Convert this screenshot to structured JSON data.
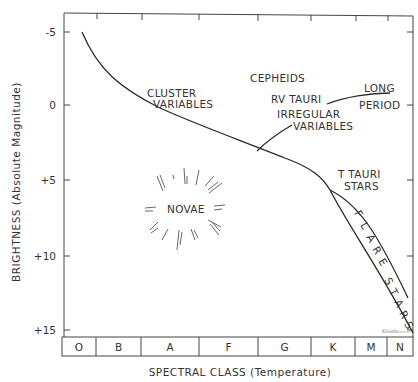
{
  "chart_data": {
    "type": "diagram",
    "title": "",
    "xlabel": "SPECTRAL CLASS (Temperature)",
    "ylabel": "BRIGHTNESS (Absolute Magnitude)",
    "ylim": [
      -5,
      15
    ],
    "y_inverted": true,
    "y_ticks": [
      "-5",
      "0",
      "+5",
      "+10",
      "+15"
    ],
    "y_tick_values": [
      -5,
      0,
      5,
      10,
      15
    ],
    "spectral_classes": [
      "O",
      "B",
      "A",
      "F",
      "G",
      "K",
      "M",
      "N"
    ],
    "curves": [
      {
        "name": "main-sequence",
        "points": [
          [
            0.1,
            -5
          ],
          [
            0.5,
            -2.5
          ],
          [
            1.0,
            -0.5
          ],
          [
            1.6,
            0.7
          ],
          [
            2.4,
            1.7
          ],
          [
            3.2,
            2.8
          ],
          [
            4.0,
            4.0
          ],
          [
            5.0,
            5.6
          ]
        ]
      },
      {
        "name": "flare-stars-upper",
        "points": [
          [
            5.0,
            5.6
          ],
          [
            5.5,
            6.5
          ],
          [
            6.0,
            8.5
          ],
          [
            6.6,
            12.5
          ]
        ]
      },
      {
        "name": "flare-stars-lower",
        "points": [
          [
            5.0,
            5.6
          ],
          [
            5.4,
            7.0
          ],
          [
            6.0,
            11.0
          ],
          [
            7.0,
            15
          ]
        ]
      },
      {
        "name": "irregular-to-long-period",
        "points": [
          [
            3.1,
            2.5
          ],
          [
            3.6,
            1.2
          ],
          [
            4.6,
            0.4
          ],
          [
            6.4,
            -0.2
          ]
        ]
      }
    ],
    "regions": [
      {
        "label": "CEPHEIDS"
      },
      {
        "label": "CLUSTER VARIABLES"
      },
      {
        "label": "RV TAURI"
      },
      {
        "label": "IRREGULAR VARIABLES"
      },
      {
        "label": "LONG PERIOD"
      },
      {
        "label": "T TAURI STARS"
      },
      {
        "label": "NOVAE"
      },
      {
        "label": "FLARE STARS"
      }
    ],
    "grid": false,
    "legend": "none"
  },
  "labels": {
    "cepheids": "CEPHEIDS",
    "cluster_1": "CLUSTER",
    "cluster_2": "VARIABLES",
    "rv_tauri": "RV TAURI",
    "irregular_1": "IRREGULAR",
    "irregular_2": "VARIABLES",
    "long": "LONG",
    "period": "PERIOD",
    "ttauri_1": "T TAURI",
    "ttauri_2": "STARS",
    "novae": "NOVAE",
    "flare": [
      "F",
      "L",
      "A",
      "R",
      "E"
    ],
    "stars": [
      "S",
      "T",
      "A",
      "R",
      "S"
    ],
    "signature": "Knuds"
  }
}
